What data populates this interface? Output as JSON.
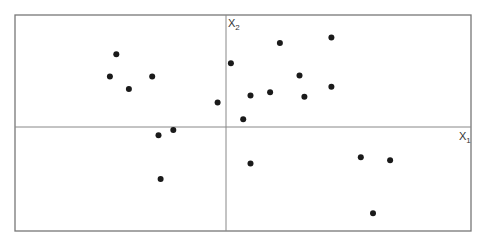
{
  "chart_data": {
    "type": "scatter",
    "title": "",
    "xlabel": "X1",
    "ylabel": "X2",
    "xlabel_main": "X",
    "xlabel_sub": "1",
    "ylabel_main": "X",
    "ylabel_sub": "2",
    "grid": false,
    "legend": null,
    "axes_through_origin": true,
    "xlim": [
      -1,
      1
    ],
    "ylim": [
      -1,
      1
    ],
    "point_color": "#1a1a1a",
    "frame_color": "#777777",
    "axis_color": "#888888",
    "points": [
      {
        "x": -0.52,
        "y": 0.65
      },
      {
        "x": -0.55,
        "y": 0.45
      },
      {
        "x": -0.35,
        "y": 0.45
      },
      {
        "x": -0.46,
        "y": 0.34
      },
      {
        "x": -0.04,
        "y": 0.22
      },
      {
        "x": 0.02,
        "y": 0.57
      },
      {
        "x": 0.22,
        "y": 0.75
      },
      {
        "x": 0.43,
        "y": 0.8
      },
      {
        "x": 0.3,
        "y": 0.46
      },
      {
        "x": 0.43,
        "y": 0.36
      },
      {
        "x": 0.1,
        "y": 0.28
      },
      {
        "x": 0.18,
        "y": 0.31
      },
      {
        "x": 0.32,
        "y": 0.27
      },
      {
        "x": 0.07,
        "y": 0.07
      },
      {
        "x": -0.32,
        "y": -0.08
      },
      {
        "x": -0.25,
        "y": -0.03
      },
      {
        "x": -0.31,
        "y": -0.5
      },
      {
        "x": 0.1,
        "y": -0.35
      },
      {
        "x": 0.55,
        "y": -0.29
      },
      {
        "x": 0.67,
        "y": -0.32
      },
      {
        "x": 0.6,
        "y": -0.83
      }
    ]
  },
  "layout": {
    "frame": {
      "left": 15,
      "top": 15,
      "right": 471,
      "bottom": 231
    },
    "origin": {
      "x": 226,
      "y": 127
    }
  }
}
